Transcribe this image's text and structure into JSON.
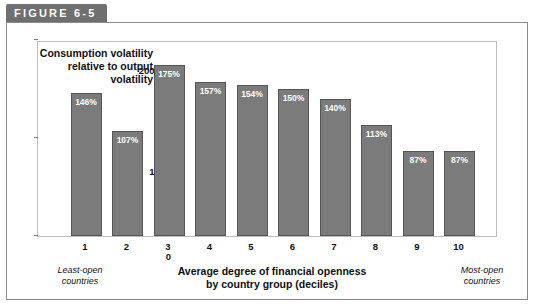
{
  "figure": {
    "tab_label": "FIGURE 6-5"
  },
  "chart_data": {
    "type": "bar",
    "title": "",
    "subtitle": "",
    "ylabel": "Consumption volatility relative to output volatility",
    "xlabel": "Average degree of financial openness by country group (deciles)",
    "categories": [
      "1",
      "2",
      "3",
      "4",
      "5",
      "6",
      "7",
      "8",
      "9",
      "10"
    ],
    "values": [
      146,
      107,
      175,
      157,
      154,
      150,
      140,
      113,
      87,
      87
    ],
    "value_labels": [
      "146%",
      "107%",
      "175%",
      "157%",
      "154%",
      "150%",
      "140%",
      "113%",
      "87%",
      "87%"
    ],
    "ylim": [
      0,
      200
    ],
    "ytick_labels": [
      "0",
      "100",
      "200%"
    ],
    "yticks": [
      0,
      100,
      200
    ],
    "grid": false,
    "legend": null,
    "annotations": [
      "Least-open countries",
      "Most-open countries"
    ],
    "bar_color": "#7b7b7b"
  },
  "axis": {
    "y_axis_note": "Consumption volatility relative to output volatility",
    "y_top_label": "200%",
    "y_mid_label": "100",
    "y_zero_label": "0",
    "x_title_line1": "Average degree of financial openness",
    "x_title_line2": "by country group (deciles)",
    "left_note_line1": "Least-open",
    "left_note_line2": "countries",
    "right_note_line1": "Most-open",
    "right_note_line2": "countries"
  }
}
